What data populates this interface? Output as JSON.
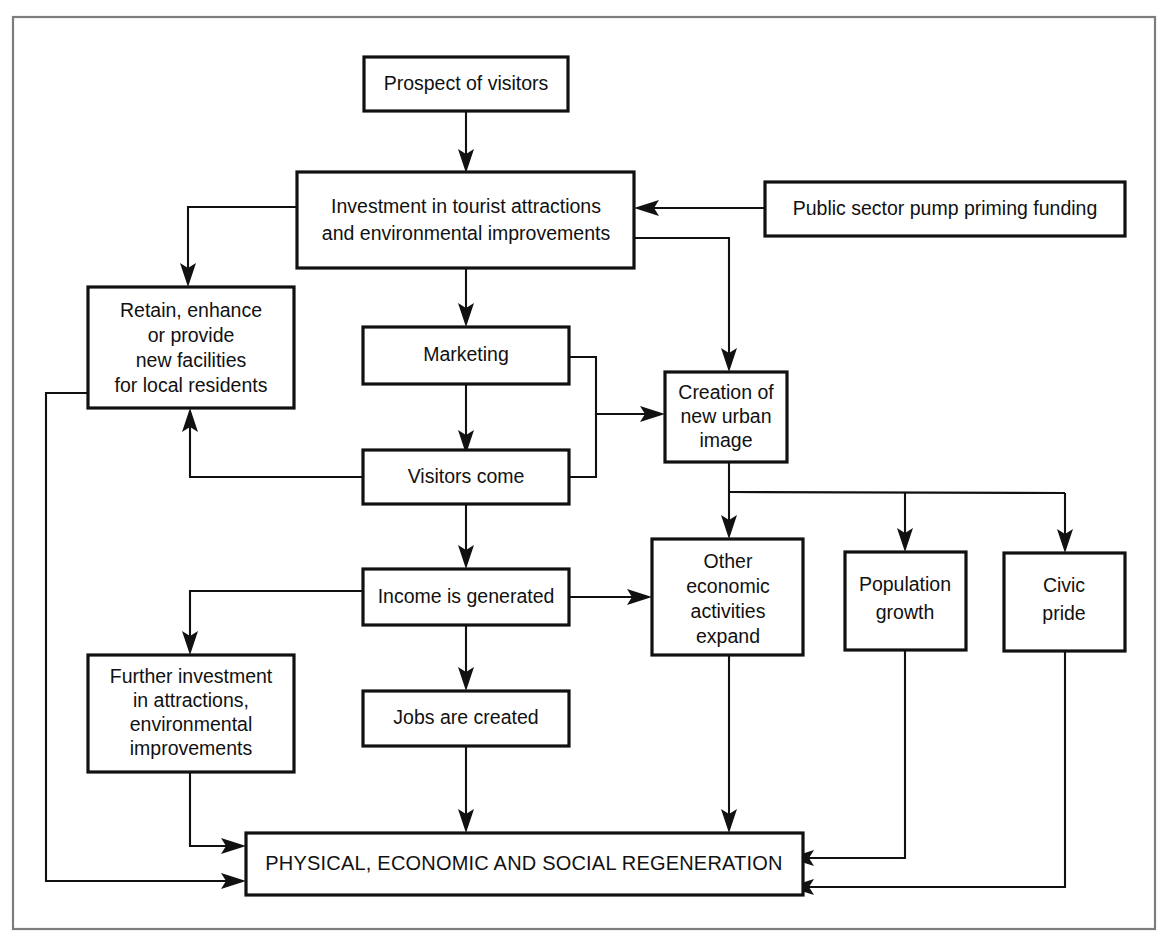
{
  "diagram": {
    "title_text": "PHYSICAL, ECONOMIC AND SOCIAL REGENERATION",
    "colors": {
      "box_stroke": "#111111",
      "box_fill": "#ffffff",
      "edge_stroke": "#111111",
      "frame_stroke": "#7c7c7c",
      "text": "#111111",
      "background": "#ffffff"
    },
    "nodes": [
      {
        "id": "prospect",
        "name": "prospect-of-visitors",
        "lines": [
          "Prospect of visitors"
        ],
        "line1": "Prospect of visitors"
      },
      {
        "id": "investment",
        "name": "investment-in-tourist-attractions",
        "lines": [
          "Investment in tourist attractions",
          "and environmental improvements"
        ],
        "line1": "Investment in tourist attractions",
        "line2": "and environmental improvements"
      },
      {
        "id": "public_sector",
        "name": "public-sector-pump-priming-funding",
        "lines": [
          "Public sector pump priming funding"
        ],
        "line1": "Public sector pump priming funding"
      },
      {
        "id": "retain",
        "name": "retain-enhance-or-provide-new-facilities",
        "lines": [
          "Retain, enhance",
          "or provide",
          "new facilities",
          "for local residents"
        ],
        "line1": "Retain, enhance",
        "line2": "or provide",
        "line3": "new facilities",
        "line4": "for local residents"
      },
      {
        "id": "marketing",
        "name": "marketing",
        "lines": [
          "Marketing"
        ],
        "line1": "Marketing"
      },
      {
        "id": "visitors_come",
        "name": "visitors-come",
        "lines": [
          "Visitors come"
        ],
        "line1": "Visitors come"
      },
      {
        "id": "urban_image",
        "name": "creation-of-new-urban-image",
        "lines": [
          "Creation of",
          "new urban",
          "image"
        ],
        "line1": "Creation of",
        "line2": "new urban",
        "line3": "image"
      },
      {
        "id": "income",
        "name": "income-is-generated",
        "lines": [
          "Income is generated"
        ],
        "line1": "Income is generated"
      },
      {
        "id": "other_economic",
        "name": "other-economic-activities-expand",
        "lines": [
          "Other",
          "economic",
          "activities",
          "expand"
        ],
        "line1": "Other",
        "line2": "economic",
        "line3": "activities",
        "line4": "expand"
      },
      {
        "id": "population",
        "name": "population-growth",
        "lines": [
          "Population",
          "growth"
        ],
        "line1": "Population",
        "line2": "growth"
      },
      {
        "id": "civic_pride",
        "name": "civic-pride",
        "lines": [
          "Civic",
          "pride"
        ],
        "line1": "Civic",
        "line2": "pride"
      },
      {
        "id": "further_investment",
        "name": "further-investment-in-attractions",
        "lines": [
          "Further investment",
          "in attractions,",
          "environmental",
          "improvements"
        ],
        "line1": "Further investment",
        "line2": "in attractions,",
        "line3": "environmental",
        "line4": "improvements"
      },
      {
        "id": "jobs",
        "name": "jobs-are-created",
        "lines": [
          "Jobs are created"
        ],
        "line1": "Jobs are created"
      },
      {
        "id": "regeneration",
        "name": "physical-economic-and-social-regeneration",
        "lines": [
          "PHYSICAL, ECONOMIC AND SOCIAL REGENERATION"
        ],
        "line1": "PHYSICAL, ECONOMIC AND SOCIAL REGENERATION"
      }
    ],
    "edges": [
      {
        "from": "prospect",
        "to": "investment",
        "label": ""
      },
      {
        "from": "public_sector",
        "to": "investment",
        "label": ""
      },
      {
        "from": "investment",
        "to": "retain",
        "label": ""
      },
      {
        "from": "investment",
        "to": "marketing",
        "label": ""
      },
      {
        "from": "investment",
        "to": "urban_image",
        "label": ""
      },
      {
        "from": "marketing",
        "to": "visitors_come",
        "label": ""
      },
      {
        "from": "marketing",
        "to": "urban_image",
        "label": ""
      },
      {
        "from": "visitors_come",
        "to": "urban_image",
        "label": ""
      },
      {
        "from": "visitors_come",
        "to": "retain",
        "label": ""
      },
      {
        "from": "visitors_come",
        "to": "income",
        "label": ""
      },
      {
        "from": "income",
        "to": "further_investment",
        "label": ""
      },
      {
        "from": "income",
        "to": "jobs",
        "label": ""
      },
      {
        "from": "income",
        "to": "other_economic",
        "label": ""
      },
      {
        "from": "urban_image",
        "to": "other_economic",
        "label": ""
      },
      {
        "from": "urban_image",
        "to": "population",
        "label": ""
      },
      {
        "from": "urban_image",
        "to": "civic_pride",
        "label": ""
      },
      {
        "from": "jobs",
        "to": "regeneration",
        "label": ""
      },
      {
        "from": "other_economic",
        "to": "regeneration",
        "label": ""
      },
      {
        "from": "population",
        "to": "regeneration",
        "label": ""
      },
      {
        "from": "civic_pride",
        "to": "regeneration",
        "label": ""
      },
      {
        "from": "further_investment",
        "to": "regeneration",
        "label": ""
      },
      {
        "from": "retain",
        "to": "regeneration",
        "label": ""
      }
    ]
  }
}
